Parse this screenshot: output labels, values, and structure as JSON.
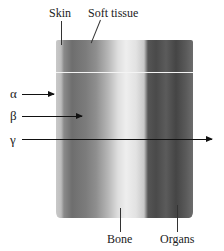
{
  "diagram": {
    "labels": {
      "skin": "Skin",
      "soft_tissue": "Soft tissue",
      "bone": "Bone",
      "organs": "Organs"
    },
    "radiation": [
      {
        "symbol": "α",
        "name": "alpha",
        "penetration": "stopped at skin"
      },
      {
        "symbol": "β",
        "name": "beta",
        "penetration": "stopped in soft tissue"
      },
      {
        "symbol": "γ",
        "name": "gamma",
        "penetration": "passes through"
      }
    ],
    "colors": {
      "skin": "#c9c9c9",
      "soft_tissue": "#7c7c7c",
      "bone": "#eeeeee",
      "organs": "#4a4a4a",
      "arrow": "#111111"
    }
  }
}
